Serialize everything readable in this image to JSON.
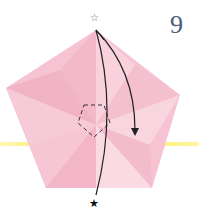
{
  "diagram": {
    "step_number": "9",
    "paper_color": "#f6c3d2",
    "highlight_color": "#fff07a",
    "top_marker": "☆",
    "bottom_marker": "★",
    "shape": "pentagon"
  }
}
